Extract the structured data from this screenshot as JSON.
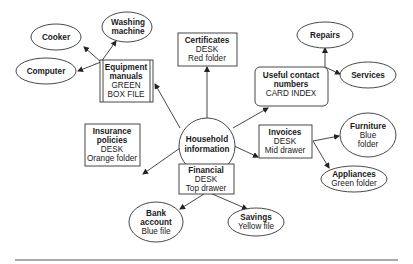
{
  "diagram": {
    "center": {
      "line1": "Household",
      "line2": "information"
    },
    "nodes": {
      "certificates": {
        "title": "Certificates",
        "lines": [
          "DESK",
          "Red folder"
        ]
      },
      "equipment": {
        "title1": "Equipment",
        "title2": "manuals",
        "lines": [
          "GREEN",
          "BOX FILE"
        ]
      },
      "contacts": {
        "title1": "Useful contact",
        "title2": "numbers",
        "lines": [
          "CARD INDEX"
        ]
      },
      "insurance": {
        "title1": "Insurance",
        "title2": "policies",
        "lines": [
          "DESK",
          "Orange folder"
        ]
      },
      "invoices": {
        "title": "Invoices",
        "lines": [
          "DESK",
          "Mid drawer"
        ]
      },
      "financial": {
        "title": "Financial",
        "lines": [
          "DESK",
          "Top drawer"
        ]
      },
      "cooker": {
        "title": "Cooker"
      },
      "washing": {
        "title1": "Washing",
        "title2": "machine"
      },
      "computer": {
        "title": "Computer"
      },
      "repairs": {
        "title": "Repairs"
      },
      "services": {
        "title": "Services"
      },
      "furniture": {
        "title": "Furniture",
        "lines": [
          "Blue",
          "folder"
        ]
      },
      "appliances": {
        "title": "Appliances",
        "lines": [
          "Green folder"
        ]
      },
      "bank": {
        "title1": "Bank",
        "title2": "account",
        "lines": [
          "Blue file"
        ]
      },
      "savings": {
        "title": "Savings",
        "lines": [
          "Yellow file"
        ]
      }
    }
  }
}
